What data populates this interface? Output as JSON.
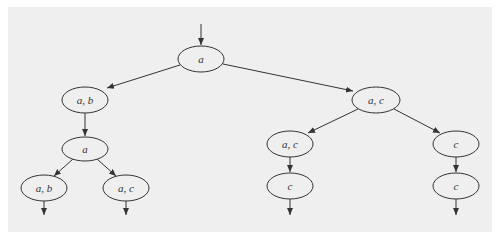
{
  "diagram": {
    "type": "tree",
    "colors": {
      "background": "#efefef",
      "stroke": "#333333",
      "page": "#ffffff"
    },
    "nodes": [
      {
        "id": "n0",
        "label": "a",
        "cx": 201,
        "cy": 59,
        "rx": 23,
        "ry": 13
      },
      {
        "id": "n1",
        "label": "a, b",
        "cx": 85,
        "cy": 100,
        "rx": 23,
        "ry": 13
      },
      {
        "id": "n2",
        "label": "a, c",
        "cx": 376,
        "cy": 100,
        "rx": 24,
        "ry": 13
      },
      {
        "id": "n3",
        "label": "a",
        "cx": 85,
        "cy": 149,
        "rx": 23,
        "ry": 12
      },
      {
        "id": "n4",
        "label": "a, c",
        "cx": 290,
        "cy": 144,
        "rx": 23,
        "ry": 13
      },
      {
        "id": "n5",
        "label": "c",
        "cx": 456,
        "cy": 144,
        "rx": 23,
        "ry": 13
      },
      {
        "id": "n6",
        "label": "a, b",
        "cx": 44,
        "cy": 188,
        "rx": 23,
        "ry": 13
      },
      {
        "id": "n7",
        "label": "a, c",
        "cx": 126,
        "cy": 188,
        "rx": 23,
        "ry": 13
      },
      {
        "id": "n8",
        "label": "c",
        "cx": 290,
        "cy": 186,
        "rx": 23,
        "ry": 13
      },
      {
        "id": "n9",
        "label": "c",
        "cx": 456,
        "cy": 186,
        "rx": 23,
        "ry": 13
      }
    ],
    "edges": [
      {
        "from": "entry",
        "to": "n0"
      },
      {
        "from": "n0",
        "to": "n1"
      },
      {
        "from": "n0",
        "to": "n2"
      },
      {
        "from": "n1",
        "to": "n3"
      },
      {
        "from": "n2",
        "to": "n4"
      },
      {
        "from": "n2",
        "to": "n5"
      },
      {
        "from": "n3",
        "to": "n6"
      },
      {
        "from": "n3",
        "to": "n7"
      },
      {
        "from": "n4",
        "to": "n8"
      },
      {
        "from": "n5",
        "to": "n9"
      },
      {
        "from": "n6",
        "to": "exit"
      },
      {
        "from": "n7",
        "to": "exit"
      },
      {
        "from": "n8",
        "to": "exit"
      },
      {
        "from": "n9",
        "to": "exit"
      }
    ]
  }
}
